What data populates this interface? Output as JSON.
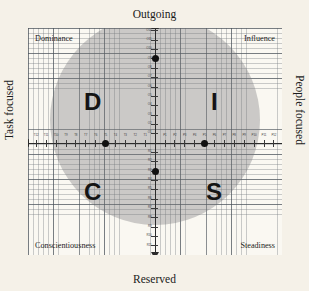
{
  "chart_data": {
    "type": "scatter",
    "xlabel": "Task focused ↔ People focused",
    "ylabel": "Reserved ↔ Outgoing",
    "xlim": [
      -12,
      12
    ],
    "ylim": [
      -12,
      12
    ],
    "grid": true,
    "legend": "none",
    "quadrants": [
      {
        "letter": "D",
        "name": "Dominance",
        "position": "top-left"
      },
      {
        "letter": "I",
        "name": "Influence",
        "position": "top-right"
      },
      {
        "letter": "C",
        "name": "Conscientiousness",
        "position": "bottom-left"
      },
      {
        "letter": "S",
        "name": "Steadiness",
        "position": "bottom-right"
      }
    ],
    "points": [
      {
        "label": "O9",
        "axis": "Outgoing",
        "x": 0,
        "y": 9
      },
      {
        "label": "T5",
        "axis": "Task focused",
        "x": -5,
        "y": 0
      },
      {
        "label": "P5",
        "axis": "People focused",
        "x": 5,
        "y": 0
      },
      {
        "label": "R3",
        "axis": "Reserved",
        "x": 0,
        "y": -3
      }
    ],
    "ticks": {
      "outgoing": [
        "O1",
        "O2",
        "O3",
        "O4",
        "O5",
        "O6",
        "O7",
        "O8",
        "O9",
        "O10",
        "O11",
        "O12"
      ],
      "reserved": [
        "R1",
        "R2",
        "R3",
        "R4",
        "R5",
        "R6",
        "R7",
        "R8",
        "R9",
        "R10",
        "R11",
        "R12"
      ],
      "task": [
        "T1",
        "T2",
        "T3",
        "T4",
        "T5",
        "T6",
        "T7",
        "T8",
        "T9",
        "T10",
        "T11",
        "T12"
      ],
      "people": [
        "P1",
        "P2",
        "P3",
        "P4",
        "P5",
        "P6",
        "P7",
        "P8",
        "P9",
        "P10",
        "P11",
        "P12"
      ]
    }
  },
  "axes": {
    "top_title": "Outgoing",
    "bottom_title": "Reserved",
    "left_title": "Task focused",
    "right_title": "People focused"
  },
  "corners": {
    "top_left": "Dominance",
    "top_right": "Influence",
    "bottom_left": "Conscientiousness",
    "bottom_right": "Steadiness"
  },
  "quadrant_letters": {
    "top_left": "D",
    "top_right": "I",
    "bottom_left": "C",
    "bottom_right": "S"
  },
  "colors": {
    "background": "#f5f1e8",
    "plot_background": "#faf8f2",
    "circle_fill": "#78787a",
    "axis": "#2b2b2b",
    "point": "#111111",
    "grid_fine": "#787d82",
    "grid_coarse": "#464e56"
  }
}
